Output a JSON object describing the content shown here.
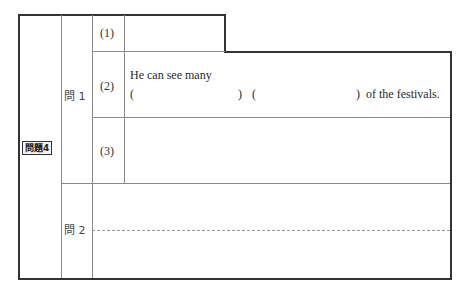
{
  "problem": {
    "label": "問題4",
    "q1": {
      "label": "問 1",
      "items": [
        {
          "number": "(1)"
        },
        {
          "number": "(2)",
          "line1": "He can see many",
          "open1": "(",
          "close1": ")",
          "open2": "(",
          "close2": ")",
          "suffix": "of the festivals."
        },
        {
          "number": "(3)"
        }
      ]
    },
    "q2": {
      "label": "問 2"
    }
  },
  "colors": {
    "border": "#333333",
    "inner_line": "#8a8a8a",
    "text": "#2a2a2a"
  }
}
